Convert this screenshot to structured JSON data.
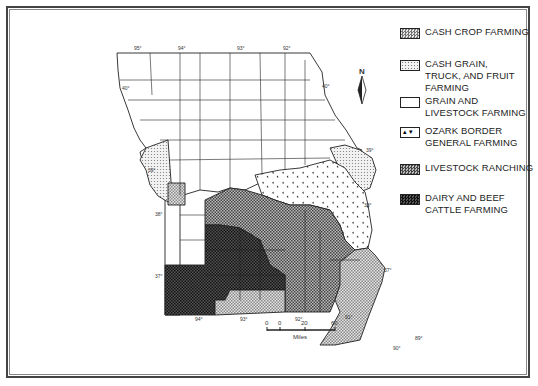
{
  "map": {
    "title": "Missouri Farming Regions",
    "longitude_labels_top": [
      "95°",
      "94°",
      "93°",
      "92°"
    ],
    "longitude_labels_bottom": [
      "94°",
      "93°",
      "92°",
      "91°",
      "90°",
      "89°"
    ],
    "latitude_labels": [
      "40°",
      "39°",
      "38°",
      "37°"
    ],
    "latitude_labels_right": [
      "40°",
      "39°",
      "38°",
      "37°"
    ],
    "north_arrow": "N",
    "scale": {
      "ticks": [
        "0",
        "0",
        "20",
        "60"
      ],
      "unit": "Miles"
    }
  },
  "legend": {
    "items": [
      {
        "label": "CASH CROP FARMING",
        "pattern": "cash-crop"
      },
      {
        "label": "CASH GRAIN, TRUCK, AND FRUIT FARMING",
        "pattern": "cash-grain"
      },
      {
        "label": "GRAIN AND LIVESTOCK FARMING",
        "pattern": "grain-livestock"
      },
      {
        "label": "OZARK BORDER GENERAL FARMING",
        "pattern": "ozark"
      },
      {
        "label": "LIVESTOCK RANCHING",
        "pattern": "ranching"
      },
      {
        "label": "DAIRY AND BEEF CATTLE FARMING",
        "pattern": "dairy"
      }
    ]
  },
  "colors": {
    "outline": "#222222",
    "cash_crop": "#bdbdbd",
    "cash_grain": "#d9d9d9",
    "grain_livestock": "#ffffff",
    "ranching": "#7a7a7a",
    "dairy": "#2e2e2e"
  }
}
